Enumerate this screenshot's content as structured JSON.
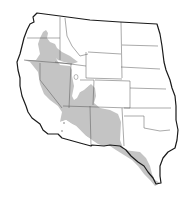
{
  "map": {
    "title": "Western United States range map",
    "region": "Western United States",
    "legend": [],
    "shaded_area": {
      "label": "range",
      "color": "#c4c4c4",
      "covers_states": [
        "Washington (east)",
        "Oregon (east)",
        "Idaho (south)",
        "Nevada",
        "Utah",
        "California (southeast)",
        "Arizona (north)",
        "New Mexico",
        "Colorado (southwest)",
        "Texas (west)"
      ]
    },
    "colors": {
      "background": "#ffffff",
      "outline": "#1a1a1a",
      "state_borders": "#555555",
      "shaded": "#c4c4c4"
    },
    "states_shown": [
      "Washington",
      "Oregon",
      "California",
      "Idaho",
      "Nevada",
      "Utah",
      "Arizona",
      "Montana",
      "Wyoming",
      "Colorado",
      "New Mexico",
      "North Dakota",
      "South Dakota",
      "Nebraska",
      "Kansas",
      "Oklahoma",
      "Texas"
    ]
  }
}
